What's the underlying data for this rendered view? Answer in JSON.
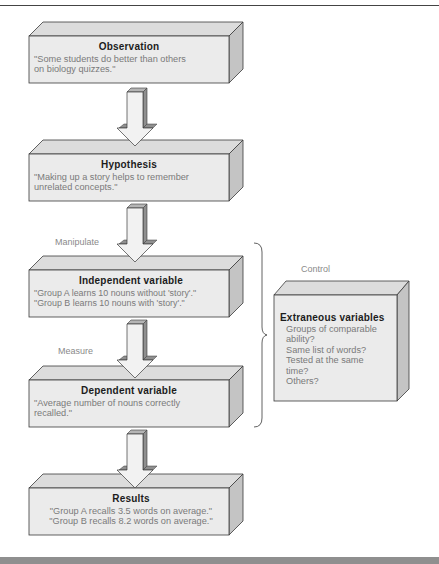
{
  "diagram": {
    "type": "flowchart",
    "colors": {
      "box_front": "#ebebeb",
      "box_top": "#dcdcdc",
      "box_side": "#c4c4c4",
      "arrow_front": "#f2f2f2",
      "arrow_side": "#8f8f8f",
      "outline": "#3a3a3a",
      "title_text": "#1c1c1c",
      "body_text": "#7a7a7a"
    },
    "boxes": [
      {
        "id": "observation",
        "title": "Observation",
        "lines": [
          "\"Some students do better than others",
          "on biology quizzes.\""
        ]
      },
      {
        "id": "hypothesis",
        "title": "Hypothesis",
        "lines": [
          "\"Making up a story helps to remember",
          "unrelated concepts.\""
        ]
      },
      {
        "id": "independent",
        "title": "Independent variable",
        "lines": [
          "\"Group A learns 10 nouns without 'story'.\"",
          "\"Group B learns 10 nouns with 'story'.\""
        ]
      },
      {
        "id": "dependent",
        "title": "Dependent variable",
        "lines": [
          "\"Average number of nouns correctly",
          "recalled.\""
        ]
      },
      {
        "id": "results",
        "title": "Results",
        "lines": [
          "\"Group A recalls 3.5 words on average.\"",
          "\"Group B recalls 8.2 words on average.\""
        ]
      }
    ],
    "arrow_labels": {
      "manipulate": "Manipulate",
      "measure": "Measure"
    },
    "control": {
      "label": "Control",
      "title": "Extraneous variables",
      "items": [
        "Groups of comparable",
        "ability?",
        "Same list of words?",
        "Tested at the same",
        "time?",
        "Others?"
      ]
    },
    "edges": [
      {
        "from": "observation",
        "to": "hypothesis",
        "label": ""
      },
      {
        "from": "hypothesis",
        "to": "independent",
        "label": "Manipulate"
      },
      {
        "from": "independent",
        "to": "dependent",
        "label": "Measure"
      },
      {
        "from": "dependent",
        "to": "results",
        "label": ""
      },
      {
        "from": "extraneous",
        "to": "independent+dependent",
        "label": "Control",
        "style": "brace"
      }
    ]
  }
}
